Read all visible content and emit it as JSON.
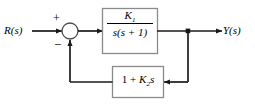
{
  "diagram": {
    "type": "control-system-block-diagram",
    "signals": {
      "input_label": "R(s)",
      "output_label": "Y(s)"
    },
    "summing_junction": {
      "name": "summing-junction",
      "positive_sign": "+",
      "negative_sign": "−",
      "positive_input": "R(s)",
      "negative_input": "feedback"
    },
    "blocks": [
      {
        "id": "forward-block",
        "role": "plant",
        "transfer_function": "K1/(s(s + 1))",
        "numerator": "K",
        "numerator_subscript": "1",
        "denominator": "s(s + 1)"
      },
      {
        "id": "feedback-block",
        "role": "feedback",
        "transfer_function": "1 + K2 s",
        "expression_prefix": "1 + ",
        "gain_symbol": "K",
        "gain_subscript": "2",
        "expression_suffix": "s"
      }
    ],
    "colors": {
      "line": "#1a1a1a",
      "block_border": "#8a8a8a",
      "block_fill": "#ffffff",
      "background": "#ffffff",
      "text": "#000000"
    }
  }
}
